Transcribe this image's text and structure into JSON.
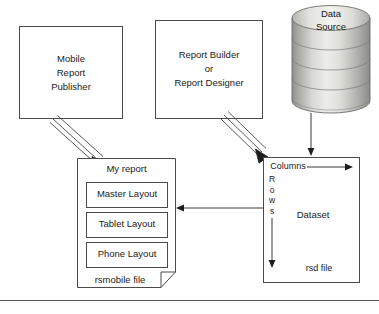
{
  "diagram": {
    "background_color": "#ffffff",
    "line_color": "#3a3a3a",
    "text_color": "#1a1a1a",
    "nodes": {
      "mobile_report_publisher": {
        "label": "Mobile\nReport\nPublisher",
        "line1": "Mobile",
        "line2": "Report",
        "line3": "Publisher",
        "shape": "rectangle"
      },
      "report_builder": {
        "line1": "Report Builder",
        "line2": "or",
        "line3": "Report Designer",
        "shape": "rectangle"
      },
      "data_source": {
        "line1": "Data",
        "line2": "Source",
        "shape": "cylinder",
        "fill_light": "#eeeeec",
        "fill_dark": "#9a9a96",
        "band_count": 4
      },
      "my_report": {
        "title": "My report",
        "footer": "rsmobile file",
        "shape": "document",
        "layouts": [
          {
            "label": "Master Layout"
          },
          {
            "label": "Tablet Layout"
          },
          {
            "label": "Phone Layout"
          }
        ]
      },
      "dataset": {
        "columns_label": "Columns",
        "rows_label": "Rows",
        "rows_letters": [
          "R",
          "o",
          "w",
          "s"
        ],
        "center_label": "Dataset",
        "footer": "rsd file",
        "shape": "rectangle"
      }
    },
    "connectors": [
      {
        "name": "publisher-to-my-report",
        "style": "block-arrow",
        "from": "mobile_report_publisher",
        "to": "my_report"
      },
      {
        "name": "builder-to-dataset",
        "style": "block-arrow",
        "from": "report_builder",
        "to": "dataset"
      },
      {
        "name": "data-source-to-dataset",
        "style": "line-arrow",
        "from": "data_source",
        "to": "dataset"
      },
      {
        "name": "dataset-to-my-report",
        "style": "line-arrow",
        "from": "dataset",
        "to": "my_report"
      },
      {
        "name": "columns-direction-arrow",
        "style": "line-arrow",
        "direction": "right"
      },
      {
        "name": "rows-direction-arrow",
        "style": "line-arrow",
        "direction": "down"
      }
    ],
    "footer_rule": {
      "name": "bottom-divider",
      "color": "#5a5a5a"
    }
  }
}
